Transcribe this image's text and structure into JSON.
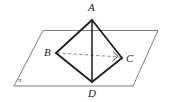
{
  "figure": {
    "type": "solid-geometry-diagram",
    "background_color": "#ffffff",
    "solid_edge_color": "#1a1a1a",
    "plane_edge_color": "#6e6e6e",
    "hidden_edge_color": "#8a8a8a",
    "labels": {
      "apex": "A",
      "left": "B",
      "right": "C",
      "bottom": "D",
      "plane": "π"
    },
    "vertices": {
      "A": {
        "x": 92,
        "y": 20
      },
      "B": {
        "x": 56,
        "y": 53
      },
      "C": {
        "x": 122,
        "y": 58
      },
      "D": {
        "x": 92,
        "y": 82
      },
      "E": {
        "x": 92,
        "y": 32
      }
    },
    "plane_corners": {
      "top_left": {
        "x": 43,
        "y": 30
      },
      "top_right": {
        "x": 158,
        "y": 30
      },
      "bottom_right": {
        "x": 133,
        "y": 86
      },
      "bottom_left": {
        "x": 14,
        "y": 86
      }
    },
    "edges": [
      {
        "name": "AB",
        "from": "A",
        "to": "B",
        "style": "solid"
      },
      {
        "name": "AC",
        "from": "A",
        "to": "C",
        "style": "solid"
      },
      {
        "name": "AD",
        "from": "A",
        "to": "D",
        "style": "solid"
      },
      {
        "name": "BD",
        "from": "B",
        "to": "D",
        "style": "solid"
      },
      {
        "name": "CD",
        "from": "C",
        "to": "D",
        "style": "solid"
      },
      {
        "name": "BC",
        "from": "B",
        "to": "C",
        "style": "dashed"
      }
    ],
    "markers": {
      "right_angle_at_C": true
    }
  }
}
